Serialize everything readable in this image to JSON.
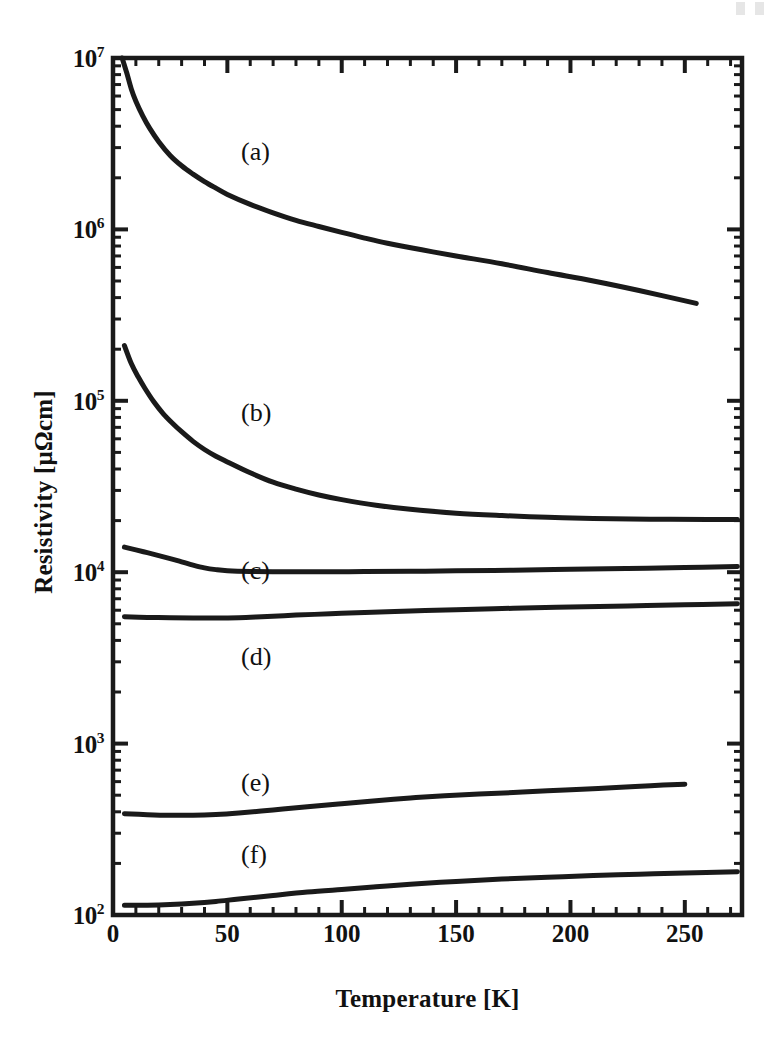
{
  "figure": {
    "background_color": "#ffffff",
    "ink_color": "#1a1a1a"
  },
  "axes": {
    "x": {
      "title": "Temperature [K]",
      "unit": "K",
      "scale": "linear",
      "min": 0,
      "max": 275,
      "tick_values": [
        0,
        50,
        100,
        150,
        200,
        250
      ],
      "tick_labels": [
        "0",
        "50",
        "100",
        "150",
        "200",
        "250"
      ],
      "minor_tick_step": 10
    },
    "y": {
      "title": "Resistivity [μΩcm]",
      "unit": "μΩcm",
      "scale": "log10",
      "min": 100,
      "max": 10000000,
      "tick_exponents": [
        2,
        3,
        4,
        5,
        6,
        7
      ],
      "tick_labels": [
        "10²",
        "10³",
        "10⁴",
        "10⁵",
        "10⁶",
        "10⁷"
      ],
      "tick_mantissas": [
        "10",
        "10",
        "10",
        "10",
        "10",
        "10"
      ],
      "tick_superscripts": [
        "2",
        "3",
        "4",
        "5",
        "6",
        "7"
      ],
      "minor_ticks": "decade subdivisions 2-9"
    },
    "frame": {
      "visible": true,
      "tick_direction": "in",
      "all_sides": true
    }
  },
  "annotations": [
    {
      "text": "(a)",
      "x_px": 241,
      "y_px": 139
    },
    {
      "text": "(b)",
      "x_px": 241,
      "y_px": 400
    },
    {
      "text": "(c)",
      "x_px": 241,
      "y_px": 558
    },
    {
      "text": "(d)",
      "x_px": 241,
      "y_px": 644
    },
    {
      "text": "(e)",
      "x_px": 241,
      "y_px": 770
    },
    {
      "text": "(f)",
      "x_px": 241,
      "y_px": 842
    }
  ],
  "chart_data": {
    "type": "line",
    "title": "",
    "xlabel": "Temperature [K]",
    "ylabel": "Resistivity [μΩcm]",
    "xscale": "linear",
    "yscale": "log",
    "xlim": [
      0,
      275
    ],
    "ylim": [
      100,
      10000000
    ],
    "grid": false,
    "legend": "inline curve labels (a)-(f)",
    "x_tick_labels": [
      "0",
      "50",
      "100",
      "150",
      "200",
      "250"
    ],
    "y_tick_labels": [
      "10²",
      "10³",
      "10⁴",
      "10⁵",
      "10⁶",
      "10⁷"
    ],
    "series": [
      {
        "name": "(a)",
        "label": "(a)",
        "color": "#1a1a1a",
        "x": [
          4,
          6,
          8,
          10,
          13,
          16,
          20,
          25,
          30,
          35,
          40,
          45,
          50,
          60,
          70,
          80,
          90,
          100,
          110,
          120,
          135,
          150,
          170,
          190,
          210,
          230,
          255
        ],
        "y": [
          10000000,
          8200000,
          6600000,
          5600000,
          4600000,
          3900000,
          3250000,
          2700000,
          2350000,
          2100000,
          1900000,
          1740000,
          1600000,
          1400000,
          1250000,
          1130000,
          1040000,
          960000,
          890000,
          830000,
          760000,
          700000,
          630000,
          560000,
          500000,
          440000,
          370000
        ]
      },
      {
        "name": "(b)",
        "label": "(b)",
        "color": "#1a1a1a",
        "x": [
          5,
          8,
          11,
          14,
          18,
          22,
          26,
          30,
          35,
          40,
          45,
          50,
          60,
          70,
          80,
          90,
          100,
          115,
          130,
          150,
          170,
          190,
          210,
          235,
          260,
          273
        ],
        "y": [
          210000,
          165000,
          138000,
          118000,
          98000,
          84000,
          74000,
          66000,
          58000,
          52000,
          47500,
          44000,
          38000,
          33500,
          30500,
          28200,
          26500,
          24600,
          23300,
          22100,
          21400,
          20900,
          20600,
          20400,
          20300,
          20300
        ]
      },
      {
        "name": "(c)",
        "label": "(c)",
        "color": "#1a1a1a",
        "x": [
          5,
          10,
          15,
          20,
          25,
          30,
          35,
          40,
          45,
          50,
          60,
          75,
          90,
          110,
          130,
          150,
          175,
          200,
          225,
          250,
          273
        ],
        "y": [
          14000,
          13500,
          13000,
          12500,
          12000,
          11500,
          11000,
          10600,
          10350,
          10200,
          10100,
          10050,
          10050,
          10080,
          10120,
          10180,
          10280,
          10400,
          10520,
          10650,
          10800
        ]
      },
      {
        "name": "(d)",
        "label": "(d)",
        "color": "#1a1a1a",
        "x": [
          5,
          15,
          25,
          35,
          45,
          55,
          65,
          80,
          95,
          110,
          130,
          150,
          175,
          200,
          225,
          250,
          273
        ],
        "y": [
          5500,
          5450,
          5420,
          5400,
          5400,
          5430,
          5500,
          5620,
          5720,
          5820,
          5940,
          6040,
          6160,
          6260,
          6360,
          6450,
          6550
        ]
      },
      {
        "name": "(e)",
        "label": "(e)",
        "color": "#1a1a1a",
        "x": [
          5,
          15,
          25,
          35,
          45,
          55,
          70,
          85,
          100,
          115,
          130,
          145,
          160,
          175,
          190,
          205,
          220,
          235,
          250
        ],
        "y": [
          390,
          385,
          382,
          382,
          386,
          394,
          410,
          428,
          446,
          464,
          482,
          497,
          508,
          518,
          530,
          542,
          554,
          568,
          580
        ]
      },
      {
        "name": "(f)",
        "label": "(f)",
        "color": "#1a1a1a",
        "x": [
          5,
          15,
          25,
          35,
          45,
          55,
          70,
          85,
          100,
          115,
          130,
          150,
          170,
          190,
          210,
          230,
          250,
          273
        ],
        "y": [
          114,
          114,
          115,
          117,
          120,
          124,
          130,
          136,
          141,
          146,
          151,
          157,
          162,
          166,
          170,
          173,
          176,
          179
        ]
      }
    ]
  }
}
